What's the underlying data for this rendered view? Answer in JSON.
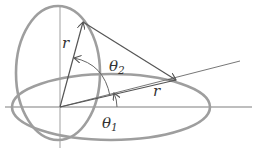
{
  "diagram": {
    "colors": {
      "ellipse": "#9e9e9e",
      "axis": "#a8a8a8",
      "vector": "#555555",
      "text": "#333333",
      "background": "#ffffff"
    },
    "labels": {
      "r_vertical": "r",
      "r_horizontal": "r",
      "theta2_symbol": "θ",
      "theta2_sub": "2",
      "theta1_symbol": "θ",
      "theta1_sub": "1"
    },
    "elements": [
      "horizontal-axis",
      "vertical-axis",
      "vertical-ellipse",
      "horizontal-ellipse",
      "tilted-line",
      "vector-r-upper",
      "vector-r-lower",
      "cone-edge-line",
      "arc-theta2",
      "arc-theta1"
    ]
  }
}
